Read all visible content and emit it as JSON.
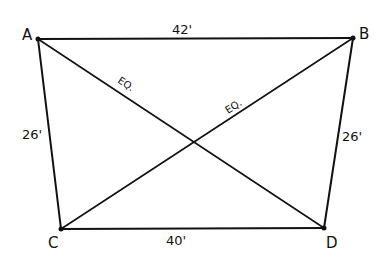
{
  "diagram": {
    "type": "quadrilateral-with-diagonals",
    "points": {
      "A": {
        "label": "A",
        "x": 38,
        "y": 39
      },
      "B": {
        "label": "B",
        "x": 353,
        "y": 38
      },
      "C": {
        "label": "C",
        "x": 61,
        "y": 229
      },
      "D": {
        "label": "D",
        "x": 324,
        "y": 228
      }
    },
    "sides": {
      "AB": {
        "label": "42'"
      },
      "CD": {
        "label": "40'"
      },
      "AC": {
        "label": "26'"
      },
      "BD": {
        "label": "26'"
      }
    },
    "diagonals": {
      "AD": {
        "label": "EQ."
      },
      "BC": {
        "label": "EQ."
      }
    },
    "colors": {
      "line": "#111111",
      "background": "#ffffff"
    }
  }
}
